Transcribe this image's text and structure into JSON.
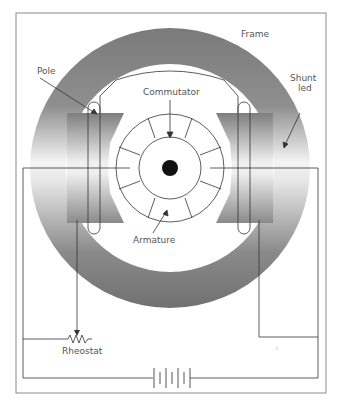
{
  "figure": {
    "labels": {
      "frame": "Frame",
      "pole": "Pole",
      "commutator": "Commutator",
      "shunt_line1": "Shunt",
      "shunt_line2": "led",
      "armature": "Armature",
      "rheostat": "Rheostat"
    },
    "components": [
      "frame",
      "pole",
      "commutator",
      "armature",
      "shaft",
      "shunt-field-coil",
      "rheostat",
      "battery"
    ],
    "colors": {
      "ring_dark": "#6e6e6e",
      "ring_light": "#ffffff",
      "line": "#333333",
      "border": "#888888",
      "text": "#555555"
    }
  }
}
